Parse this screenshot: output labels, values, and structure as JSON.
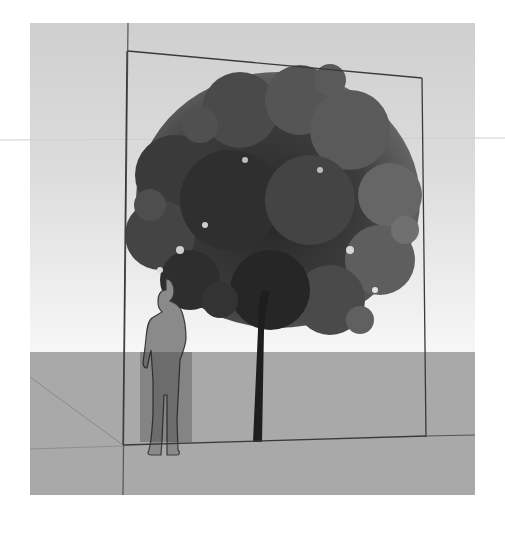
{
  "scene": {
    "type": "3d-modeling-viewport",
    "description": "Tree billboard component with human scale figure",
    "colors": {
      "background": "#ffffff",
      "sky_top": "#d0d0d0",
      "sky_bottom": "#f6f6f6",
      "ground": "#a9a9a9",
      "edge_line": "#3a3a3a",
      "axis_line": "#7a7a7a",
      "figure": "#8a8a8a",
      "foliage_dark": "#2e2e2e",
      "foliage_mid": "#555555",
      "foliage_light": "#7a7a7a"
    },
    "viewport": {
      "x": 30,
      "y": 23,
      "width": 445,
      "height": 472,
      "horizon_y": 352
    },
    "objects": [
      {
        "name": "tree-billboard",
        "label": ""
      },
      {
        "name": "scale-figure",
        "label": ""
      }
    ]
  }
}
